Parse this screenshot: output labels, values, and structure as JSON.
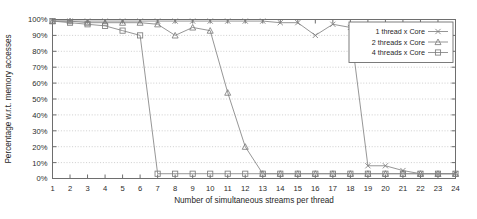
{
  "chart_data": {
    "type": "line",
    "title": "",
    "xlabel": "Number of simultaneous streams per thread",
    "ylabel": "Percentage w.r.t. memory accesses",
    "xlim": [
      1,
      24
    ],
    "ylim": [
      0,
      100
    ],
    "grid": true,
    "legend_position": "top-right",
    "x": [
      1,
      2,
      3,
      4,
      5,
      6,
      7,
      8,
      9,
      10,
      11,
      12,
      13,
      14,
      15,
      16,
      17,
      18,
      19,
      20,
      21,
      22,
      23,
      24
    ],
    "xtick_labels": [
      "1",
      "2",
      "3",
      "4",
      "5",
      "6",
      "7",
      "8",
      "9",
      "10",
      "11",
      "12",
      "13",
      "14",
      "15",
      "16",
      "17",
      "18",
      "19",
      "20",
      "21",
      "22",
      "23",
      "24"
    ],
    "ytick_labels": [
      "0%",
      "10%",
      "20%",
      "30%",
      "40%",
      "50%",
      "60%",
      "70%",
      "80%",
      "90%",
      "100%"
    ],
    "ytick_values": [
      0,
      10,
      20,
      30,
      40,
      50,
      60,
      70,
      80,
      90,
      100
    ],
    "series": [
      {
        "name": "1 thread x Core",
        "marker": "cross",
        "values": [
          99,
          99,
          99,
          99,
          99,
          99,
          99,
          99,
          99,
          99,
          99,
          99,
          99,
          98,
          98,
          90,
          97,
          95,
          8,
          8,
          5,
          3,
          3,
          3
        ]
      },
      {
        "name": "2 threads x Core",
        "marker": "triangle",
        "values": [
          99,
          99,
          98,
          98,
          98,
          98,
          97,
          90,
          95,
          93,
          54,
          20,
          3,
          3,
          3,
          3,
          3,
          3,
          3,
          3,
          3,
          3,
          3,
          3
        ]
      },
      {
        "name": "4 threads x Core",
        "marker": "square",
        "values": [
          99,
          98,
          97,
          96,
          93,
          90,
          3,
          3,
          3,
          3,
          3,
          3,
          3,
          3,
          3,
          3,
          3,
          3,
          3,
          3,
          3,
          3,
          3,
          3
        ]
      }
    ]
  },
  "colors": {
    "series_line": "#8a8a8a",
    "axis": "#6e6e6e",
    "grid": "#b9b9b9",
    "text": "#1f1f1f",
    "background": "#ffffff"
  }
}
